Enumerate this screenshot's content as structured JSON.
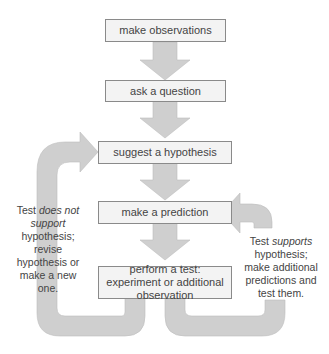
{
  "colors": {
    "arrow": "#cfcfcf",
    "box_fill": "#f3f3f3",
    "box_border": "#8a8a8a",
    "text": "#444444"
  },
  "steps": [
    {
      "label": "make observations"
    },
    {
      "label": "ask a question"
    },
    {
      "label": "suggest a hypothesis"
    },
    {
      "label": "make a prediction"
    },
    {
      "label": "perform a test: experiment or additional observation"
    }
  ],
  "left_note": {
    "prefix": "Test ",
    "italic": "does not support",
    "suffix": " hypothesis; revise hypothesis or make a new one."
  },
  "right_note": {
    "prefix": "Test ",
    "italic": "supports",
    "suffix": " hypothesis; make additional predictions and test them."
  }
}
